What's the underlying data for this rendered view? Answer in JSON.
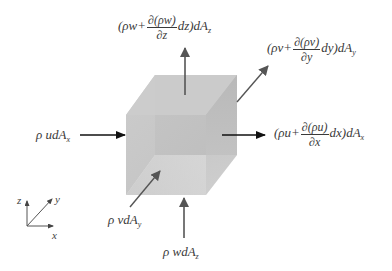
{
  "diagram": {
    "cube": {
      "front_color": "#c8c8c8",
      "side_color": "#b4b4b4",
      "top_color": "#d6d6d6",
      "bottom_color": "#e6e6e6"
    },
    "arrows": {
      "inflow_x": {
        "label_prefix": "ρ udA",
        "subscript": "x"
      },
      "outflow_x": {
        "prefix": "(ρu+",
        "frac_num": "∂(ρu)",
        "frac_den": "∂x",
        "suffix": "dx)dA",
        "subscript": "x"
      },
      "inflow_y": {
        "label_prefix": "ρ vdA",
        "subscript": "y"
      },
      "outflow_y": {
        "prefix": "(ρv+",
        "frac_num": "∂(ρv)",
        "frac_den": "∂y",
        "suffix": "dy)dA",
        "subscript": "y"
      },
      "inflow_z": {
        "label_prefix": "ρ wdA",
        "subscript": "z"
      },
      "outflow_z": {
        "prefix": "(ρw+",
        "frac_num": "∂(ρw)",
        "frac_den": "∂z",
        "suffix": "dz)dA",
        "subscript": "z"
      }
    },
    "axes": {
      "x_label": "x",
      "y_label": "y",
      "z_label": "z"
    }
  }
}
